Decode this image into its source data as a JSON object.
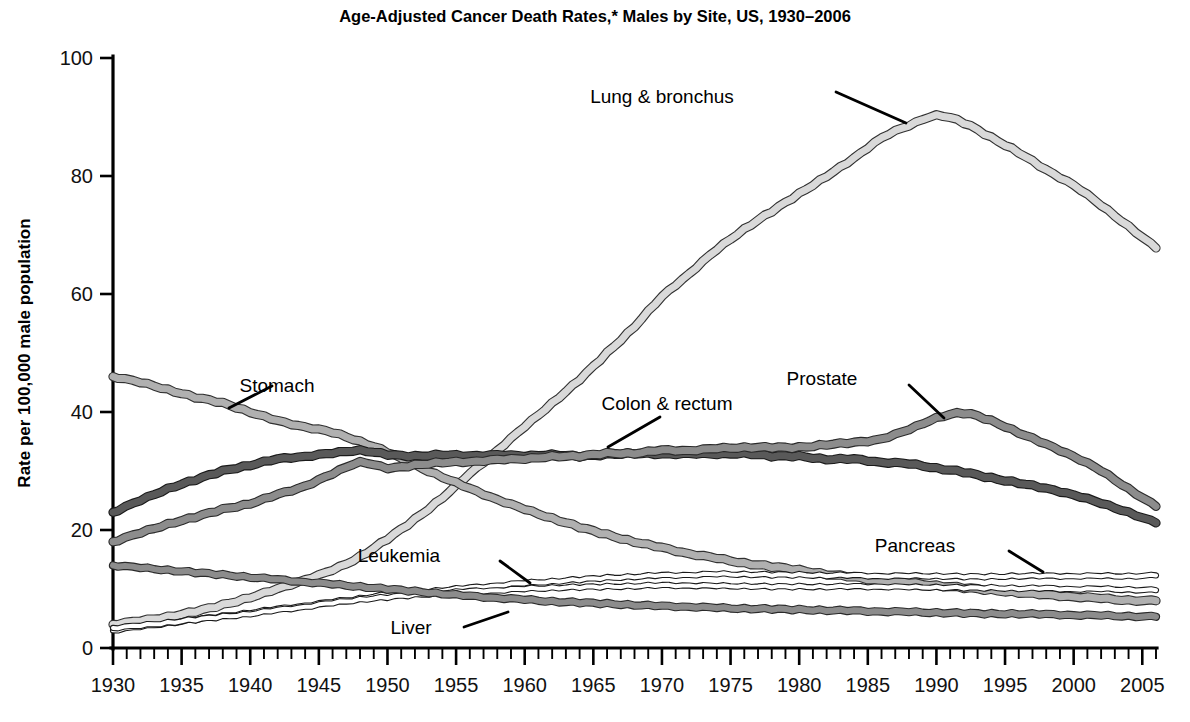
{
  "chart_data": {
    "type": "line",
    "title": "Age-Adjusted Cancer Death Rates,* Males by Site, US, 1930–2006",
    "xlabel": "",
    "ylabel": "Rate per 100,000 male population",
    "xlim": [
      1930,
      2006
    ],
    "ylim": [
      0,
      100
    ],
    "ytick_labels": [
      "0",
      "20",
      "40",
      "60",
      "80",
      "100"
    ],
    "ytick_values": [
      0,
      20,
      40,
      60,
      80,
      100
    ],
    "xtick_labels": [
      "1930",
      "1935",
      "1940",
      "1945",
      "1950",
      "1955",
      "1960",
      "1965",
      "1970",
      "1975",
      "1980",
      "1985",
      "1990",
      "1995",
      "2000",
      "2005"
    ],
    "xtick_values": [
      1930,
      1935,
      1940,
      1945,
      1950,
      1955,
      1960,
      1965,
      1970,
      1975,
      1980,
      1985,
      1990,
      1995,
      2000,
      2005
    ],
    "xtick_minor_interval": 1,
    "grid": false,
    "legend": "inline-annotations",
    "footnote": "* per 100,000, age adjusted",
    "x": [
      1930,
      1932,
      1934,
      1936,
      1938,
      1940,
      1942,
      1944,
      1946,
      1948,
      1950,
      1952,
      1954,
      1956,
      1958,
      1960,
      1962,
      1964,
      1966,
      1968,
      1970,
      1972,
      1974,
      1976,
      1978,
      1980,
      1982,
      1984,
      1986,
      1988,
      1990,
      1992,
      1994,
      1996,
      1998,
      2000,
      2002,
      2004,
      2006
    ],
    "series": [
      {
        "name": "Lung & bronchus",
        "color": "#d9d9d9",
        "outline": "#303030",
        "width": 7,
        "label_x": 1975,
        "label_y": 93,
        "values": [
          4.0,
          4.6,
          5.3,
          6.2,
          7.3,
          8.6,
          10.0,
          11.6,
          13.2,
          15.5,
          18.5,
          21.8,
          25.5,
          29.5,
          33.5,
          37.5,
          41.5,
          45.5,
          50.0,
          54.5,
          59.5,
          63.5,
          67.5,
          71.0,
          74.0,
          77.0,
          80.0,
          83.0,
          86.5,
          88.5,
          90.3,
          89.0,
          86.5,
          84.0,
          81.0,
          78.5,
          75.0,
          71.5,
          67.8
        ]
      },
      {
        "name": "Stomach",
        "color": "#b0b0b0",
        "outline": "#303030",
        "width": 7,
        "label_x": 1943,
        "label_y": 43.5,
        "values": [
          46.0,
          45.0,
          43.8,
          42.5,
          41.5,
          40.0,
          38.5,
          37.5,
          36.5,
          35.0,
          33.2,
          31.0,
          29.0,
          27.0,
          25.2,
          23.5,
          22.0,
          20.5,
          19.2,
          18.0,
          17.0,
          16.0,
          15.2,
          14.4,
          13.8,
          13.2,
          12.5,
          12.0,
          11.4,
          11.0,
          10.6,
          10.2,
          9.8,
          9.4,
          9.0,
          8.7,
          8.4,
          8.1,
          8.0
        ]
      },
      {
        "name": "Colon & rectum",
        "color": "#595959",
        "outline": "#1a1a1a",
        "width": 7,
        "label_x": 1963,
        "label_y": 41.5,
        "values": [
          23.0,
          25.0,
          27.0,
          28.5,
          30.0,
          31.0,
          32.0,
          32.5,
          33.0,
          33.5,
          32.8,
          32.5,
          32.8,
          32.5,
          32.8,
          32.5,
          32.8,
          32.5,
          32.8,
          33.0,
          32.8,
          33.0,
          32.8,
          33.0,
          32.5,
          32.5,
          32.0,
          32.0,
          31.5,
          31.2,
          30.5,
          29.8,
          28.8,
          28.0,
          27.0,
          26.0,
          24.5,
          23.0,
          21.2
        ]
      },
      {
        "name": "Prostate",
        "color": "#8c8c8c",
        "outline": "#2a2a2a",
        "width": 7,
        "label_x": 1980,
        "label_y": 44.5,
        "values": [
          18.0,
          19.5,
          21.0,
          22.2,
          23.5,
          24.5,
          26.0,
          27.5,
          29.5,
          31.5,
          30.5,
          31.0,
          31.5,
          31.5,
          32.0,
          32.0,
          32.5,
          32.5,
          33.0,
          33.0,
          33.5,
          33.5,
          33.8,
          34.0,
          34.0,
          34.0,
          34.5,
          34.8,
          35.5,
          37.0,
          39.0,
          39.8,
          38.5,
          36.5,
          34.5,
          32.5,
          30.0,
          27.0,
          24.0
        ]
      },
      {
        "name": "Pancreas",
        "color": "#ffffff",
        "outline": "#1a1a1a",
        "width": 4,
        "label_x": 1983,
        "label_y": 16.2,
        "values": [
          3.0,
          3.6,
          4.2,
          4.8,
          5.4,
          6.0,
          6.6,
          7.2,
          7.8,
          8.4,
          9.0,
          9.4,
          9.8,
          10.2,
          10.6,
          11.0,
          11.3,
          11.6,
          11.9,
          12.1,
          12.3,
          12.4,
          12.5,
          12.5,
          12.4,
          12.4,
          12.3,
          12.3,
          12.2,
          12.2,
          12.2,
          12.1,
          12.1,
          12.2,
          12.2,
          12.2,
          12.2,
          12.2,
          12.3
        ]
      },
      {
        "name": "Leukemia",
        "color": "#ffffff",
        "outline": "#1a1a1a",
        "width": 4,
        "label_x": 1953,
        "label_y": 15.6,
        "values": [
          3.4,
          3.8,
          4.3,
          4.8,
          5.3,
          5.8,
          6.4,
          7.0,
          7.6,
          8.2,
          8.6,
          9.0,
          9.3,
          9.6,
          9.8,
          10.0,
          10.2,
          10.3,
          10.4,
          10.5,
          10.6,
          10.6,
          10.5,
          10.5,
          10.4,
          10.4,
          10.4,
          10.4,
          10.4,
          10.3,
          10.3,
          10.2,
          10.2,
          10.1,
          10.1,
          10.0,
          10.0,
          9.9,
          9.8
        ]
      },
      {
        "name": "Liver",
        "color": "#8c8c8c",
        "outline": "#2a2a2a",
        "width": 6,
        "label_x": 1950,
        "label_y": 5.2,
        "values": [
          14.0,
          13.6,
          13.2,
          12.8,
          12.4,
          12.0,
          11.6,
          11.2,
          10.8,
          10.4,
          10.0,
          9.6,
          9.2,
          8.8,
          8.5,
          8.2,
          7.9,
          7.7,
          7.5,
          7.3,
          7.1,
          7.0,
          6.8,
          6.7,
          6.6,
          6.5,
          6.4,
          6.3,
          6.2,
          6.1,
          6.0,
          5.9,
          5.8,
          5.8,
          5.7,
          5.6,
          5.5,
          5.4,
          5.3
        ]
      }
    ],
    "annotations": [
      {
        "name": "lung-bronchus",
        "text": "Lung & bronchus",
        "text_x": 662,
        "text_y": 103,
        "leader": "M 836,92 L 906,123"
      },
      {
        "name": "stomach",
        "text": "Stomach",
        "text_x": 277,
        "text_y": 392,
        "leader": "M 272,386 L 229,408"
      },
      {
        "name": "colon-rectum",
        "text": "Colon & rectum",
        "text_x": 667,
        "text_y": 410,
        "leader": "M 660,417 L 608,447"
      },
      {
        "name": "prostate",
        "text": "Prostate",
        "text_x": 822,
        "text_y": 385,
        "leader": "M 909,385 L 944,418"
      },
      {
        "name": "leukemia",
        "text": "Leukemia",
        "text_x": 399,
        "text_y": 562,
        "leader": "M 500,561 L 530,583"
      },
      {
        "name": "liver",
        "text": "Liver",
        "text_x": 411,
        "text_y": 634,
        "leader": "M 464,627 L 508,612"
      },
      {
        "name": "pancreas",
        "text": "Pancreas",
        "text_x": 915,
        "text_y": 552,
        "leader": "M 1009,551 L 1043,572"
      }
    ]
  },
  "axes": {
    "y_axis_title": "Rate per 100,000 male population"
  }
}
